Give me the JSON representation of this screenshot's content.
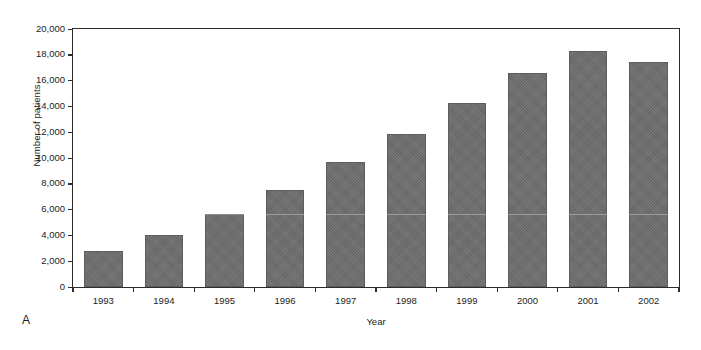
{
  "figure": {
    "panel_letter": "A",
    "background_color": "#ffffff",
    "bar_color": "#6e6e6e",
    "axis_color": "#2b2b2b"
  },
  "chart_data": {
    "type": "bar",
    "title": "",
    "subtitle": "",
    "xlabel": "Year",
    "ylabel": "Number of patients",
    "categories": [
      "1993",
      "1994",
      "1995",
      "1996",
      "1997",
      "1998",
      "1999",
      "2000",
      "2001",
      "2002"
    ],
    "values": [
      2800,
      4050,
      5650,
      7500,
      9700,
      11850,
      14300,
      16600,
      18300,
      17450
    ],
    "series": [
      {
        "name": "Number of patients",
        "values": [
          2800,
          4050,
          5650,
          7500,
          9700,
          11850,
          14300,
          16600,
          18300,
          17450
        ]
      }
    ],
    "ylim": [
      0,
      20000
    ],
    "yticks": [
      0,
      2000,
      4000,
      6000,
      8000,
      10000,
      12000,
      14000,
      16000,
      18000,
      20000
    ],
    "ytick_labels": [
      "0",
      "2,000",
      "4,000",
      "6,000",
      "8,000",
      "10,000",
      "12,000",
      "14,000",
      "16,000",
      "18,000",
      "20,000"
    ],
    "grid": false,
    "legend": null,
    "legend_position": "none",
    "annotations": [
      "A"
    ]
  }
}
